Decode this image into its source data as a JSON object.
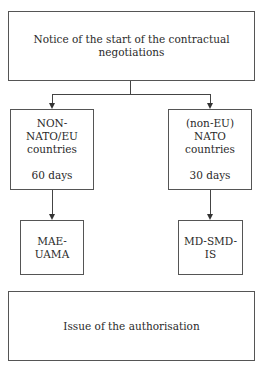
{
  "diagram": {
    "top": {
      "label": "Notice of the start of the contractual negotiations"
    },
    "left_branch": {
      "line1": "NON-NATO/EU",
      "line2": "countries",
      "duration": "60 days",
      "authority": "MAE-UAMA"
    },
    "right_branch": {
      "line1": "(non-EU) NATO",
      "line2": "countries",
      "duration": "30 days",
      "authority": "MD-SMD-IS"
    },
    "bottom": {
      "label": "Issue of the authorisation"
    }
  }
}
